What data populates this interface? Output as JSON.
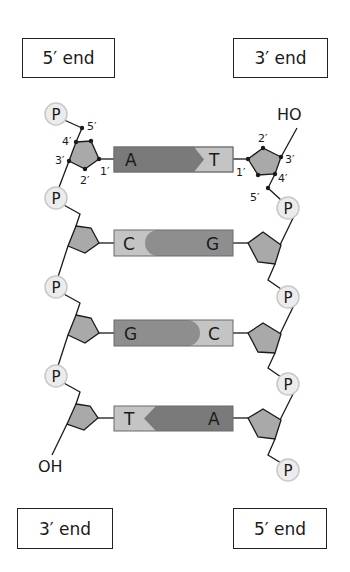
{
  "diagram": {
    "title_boxes": {
      "top_left": "5′ end",
      "top_right": "3′ end",
      "bottom_left": "3′ end",
      "bottom_right": "5′ end"
    },
    "left_strand": {
      "phosphate_label": "P",
      "terminal_group": "OH",
      "carbon_labels": {
        "c1": "1′",
        "c2": "2′",
        "c3": "3′",
        "c4": "4′",
        "c5": "5′"
      }
    },
    "right_strand": {
      "phosphate_label": "P",
      "terminal_group": "HO",
      "carbon_labels": {
        "c1": "1′",
        "c2": "2′",
        "c3": "3′",
        "c4": "4′",
        "c5": "5′"
      }
    },
    "base_pairs": [
      {
        "left": "A",
        "right": "T",
        "shape": "purine-left-arrow"
      },
      {
        "left": "C",
        "right": "G",
        "shape": "purine-right-round"
      },
      {
        "left": "G",
        "right": "C",
        "shape": "purine-left-round"
      },
      {
        "left": "T",
        "right": "A",
        "shape": "purine-right-arrow"
      }
    ],
    "colors": {
      "purine": "#7a7a7a",
      "pyrimidine": "#c4c4c4",
      "sugar": "#a9a9a9",
      "phosphate_fill": "#ececec",
      "phosphate_stroke": "#c8c8c8",
      "line": "#1a1a1a"
    }
  }
}
